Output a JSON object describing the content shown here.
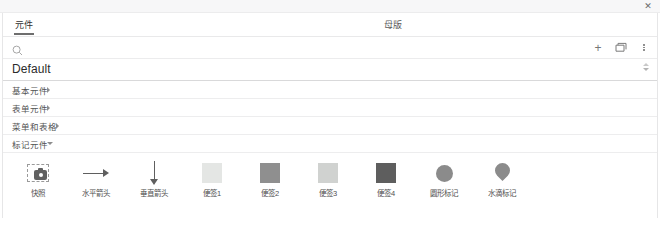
{
  "window": {
    "close_label": "✕"
  },
  "tabs": [
    {
      "label": "元件",
      "name": "tab-components",
      "active": true
    },
    {
      "label": "母版",
      "name": "tab-masters",
      "active": false
    }
  ],
  "search": {
    "value": "",
    "placeholder": "",
    "icon": "search-icon"
  },
  "toolbar": {
    "add_label": "+",
    "add_icon": "plus-icon",
    "library_icon": "folder-library-icon",
    "menu_icon": "more-vertical-icon"
  },
  "library": {
    "selected": "Default",
    "caret_icon": "chevron-updown-icon"
  },
  "categories": [
    {
      "label": "基本元件",
      "expanded": false
    },
    {
      "label": "表单元件",
      "expanded": false
    },
    {
      "label": "菜单和表格",
      "expanded": false
    },
    {
      "label": "标记元件",
      "expanded": true
    }
  ],
  "widgets": [
    {
      "label": "快照",
      "icon": "snapshot-icon",
      "color": "#616161"
    },
    {
      "label": "水平箭头",
      "icon": "arrow-right-icon",
      "color": "#5f5f5f"
    },
    {
      "label": "垂直箭头",
      "icon": "arrow-down-icon",
      "color": "#5f5f5f"
    },
    {
      "label": "便签1",
      "icon": "sticky-note-icon",
      "color": "#e4e6e4"
    },
    {
      "label": "便签2",
      "icon": "sticky-note-icon",
      "color": "#8f8f8f"
    },
    {
      "label": "便签3",
      "icon": "sticky-note-icon",
      "color": "#d0d2d0"
    },
    {
      "label": "便签4",
      "icon": "sticky-note-icon",
      "color": "#5e5e5e"
    },
    {
      "label": "圆形标记",
      "icon": "circle-marker-icon",
      "color": "#8b8b8b"
    },
    {
      "label": "水滴标记",
      "icon": "drop-marker-icon",
      "color": "#8b8b8b"
    }
  ],
  "colors": {
    "panel_border": "#e6e6e7",
    "divider": "#ededee",
    "text": "#4f4f4f",
    "tab_underline": "#6e6e6e"
  }
}
